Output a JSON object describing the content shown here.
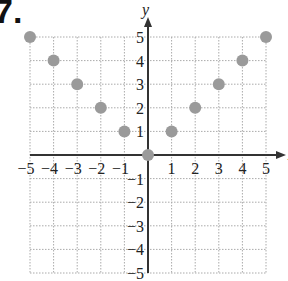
{
  "problem": {
    "number": "7."
  },
  "chart_data": {
    "type": "scatter",
    "title": "",
    "xlabel": "x",
    "ylabel": "y",
    "xlim": [
      -5,
      5
    ],
    "ylim": [
      -5,
      5
    ],
    "grid": true,
    "grid_style": "dotted",
    "x_ticks": [
      -5,
      -4,
      -3,
      -2,
      -1,
      1,
      2,
      3,
      4,
      5
    ],
    "y_ticks": [
      -5,
      -4,
      -3,
      -2,
      -1,
      1,
      2,
      3,
      4,
      5
    ],
    "x_tick_labels": [
      "−5",
      "−4",
      "−3",
      "−2",
      "−1",
      "1",
      "2",
      "3",
      "4",
      "5"
    ],
    "y_tick_labels": [
      "−5",
      "−4",
      "−3",
      "−2",
      "−1",
      "1",
      "2",
      "3",
      "4",
      "5"
    ],
    "points": [
      {
        "x": -5,
        "y": 5
      },
      {
        "x": -4,
        "y": 4
      },
      {
        "x": -3,
        "y": 3
      },
      {
        "x": -2,
        "y": 2
      },
      {
        "x": -1,
        "y": 1
      },
      {
        "x": 0,
        "y": 0
      },
      {
        "x": 1,
        "y": 1
      },
      {
        "x": 2,
        "y": 2
      },
      {
        "x": 3,
        "y": 3
      },
      {
        "x": 4,
        "y": 4
      },
      {
        "x": 5,
        "y": 5
      }
    ],
    "point_color": "#9a9a9a",
    "axis_color": "#333333",
    "grid_color": "#aaaaaa"
  }
}
